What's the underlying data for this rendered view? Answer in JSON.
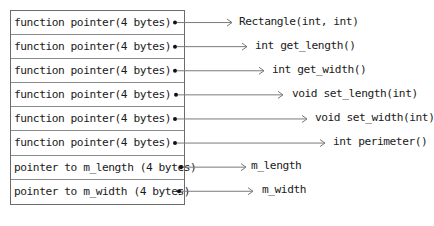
{
  "diagram": {
    "title": "",
    "rows": [
      {
        "label": "function pointer(4 bytes)",
        "target": "Rectangle(int, int)",
        "dot_x": 175,
        "arrow_end_x": 232,
        "target_x": 239
      },
      {
        "label": "function pointer(4 bytes)",
        "target": "int get_length()",
        "dot_x": 175,
        "arrow_end_x": 247,
        "target_x": 255
      },
      {
        "label": "function pointer(4 bytes)",
        "target": "int get_width()",
        "dot_x": 175,
        "arrow_end_x": 264,
        "target_x": 272
      },
      {
        "label": "function pointer(4 bytes)",
        "target": "void set_length(int)",
        "dot_x": 176,
        "arrow_end_x": 283,
        "target_x": 292
      },
      {
        "label": "function pointer(4 bytes)",
        "target": "void set_width(int)",
        "dot_x": 175,
        "arrow_end_x": 307,
        "target_x": 315
      },
      {
        "label": "function pointer(4 bytes)",
        "target": "int perimeter()",
        "dot_x": 175,
        "arrow_end_x": 325,
        "target_x": 333
      },
      {
        "label": "pointer to m_length (4 bytes)",
        "target": "m_length",
        "dot_x": 181,
        "arrow_end_x": 246,
        "target_x": 251
      },
      {
        "label": "pointer to m_width (4 bytes)",
        "target": "m_width",
        "dot_x": 179,
        "arrow_end_x": 253,
        "target_x": 262
      }
    ]
  }
}
